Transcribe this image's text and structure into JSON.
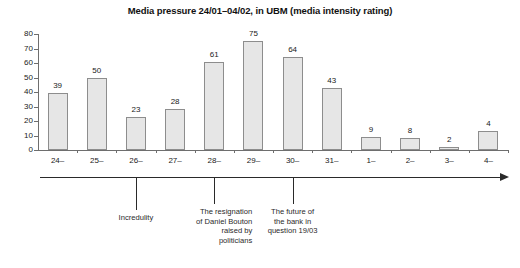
{
  "chart_data": {
    "type": "bar",
    "title": "Media pressure 24/01–04/02, in UBM (media intensity rating)",
    "xlabel": "",
    "ylabel": "",
    "ylim": [
      0,
      80
    ],
    "ytick_step": 10,
    "grid": false,
    "legend": "none",
    "bar_color": "#e6e6e6",
    "bar_border_color": "#8d8d8d",
    "categories": [
      "24–",
      "25–",
      "26–",
      "27–",
      "28–",
      "29–",
      "30–",
      "31–",
      "1–",
      "2–",
      "3–",
      "4–"
    ],
    "values": [
      39,
      50,
      23,
      28,
      61,
      75,
      64,
      43,
      9,
      8,
      2,
      4
    ],
    "yticks": [
      "0",
      "10",
      "20",
      "30",
      "40",
      "50",
      "60",
      "70",
      "80"
    ],
    "annotations": [
      {
        "text": "Incredulity",
        "category": "26–"
      },
      {
        "text": "The resignation of Daniel Bouton raised by politicians",
        "category": "28–"
      },
      {
        "text": "The future of the bank in question 19/03",
        "category": "30–"
      }
    ]
  },
  "annotation_lines": {
    "a0": [
      "Incredulity"
    ],
    "a1": [
      "The resignation",
      "of Daniel Bouton",
      "raised by",
      "politicians"
    ],
    "a2": [
      "The future of",
      "the bank in",
      "question 19/03"
    ]
  }
}
